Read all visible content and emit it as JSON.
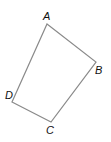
{
  "figure": {
    "type": "quadrilateral",
    "stroke_color": "#8a8a8a",
    "label_color": "#111111",
    "vertices": [
      {
        "name": "A",
        "x": 47,
        "y": 24,
        "label_x": 43,
        "label_y": 20
      },
      {
        "name": "B",
        "x": 96,
        "y": 62,
        "label_x": 95,
        "label_y": 74
      },
      {
        "name": "C",
        "x": 51,
        "y": 122,
        "label_x": 46,
        "label_y": 134
      },
      {
        "name": "D",
        "x": 12,
        "y": 102,
        "label_x": 5,
        "label_y": 99
      }
    ]
  }
}
